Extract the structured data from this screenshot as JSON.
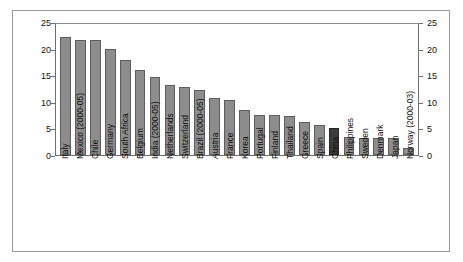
{
  "chart_data": {
    "type": "bar",
    "title": "",
    "subtitle": "",
    "xlabel": "",
    "ylabel": "",
    "ylim": [
      0,
      25
    ],
    "yticks": [
      0,
      5,
      10,
      15,
      20,
      25
    ],
    "grid": false,
    "legend": null,
    "dual_y_axis": true,
    "highlight_category": "China",
    "colors": {
      "bar": "#8d8d8d",
      "bar_edge": "#5d5d5d",
      "highlight_bar": "#3b3b3b",
      "highlight_edge": "#242424",
      "axis": "#6e6e6e",
      "frame": "#9a9a9a",
      "text": "#111111",
      "background": "#ffffff"
    },
    "categories": [
      "Italy",
      "Mexico (2000-05)",
      "Chile",
      "Germany",
      "South Africa",
      "Belgium",
      "India (2000-05)",
      "Netherlands",
      "Switzerland",
      "Brazil (2000-05)",
      "Austria",
      "France",
      "Korea",
      "Portugal",
      "Finland",
      "Thailand",
      "Greece",
      "Spain",
      "China",
      "Philippines",
      "Sweden",
      "Denmark",
      "Japan",
      "Norway (2000-03)"
    ],
    "values": [
      22.2,
      21.7,
      21.7,
      19.9,
      17.8,
      15.9,
      14.7,
      13.1,
      12.7,
      12.2,
      10.8,
      10.3,
      8.4,
      7.6,
      7.5,
      7.4,
      6.2,
      5.7,
      5.0,
      3.3,
      3.2,
      3.2,
      3.2,
      1.4
    ]
  }
}
